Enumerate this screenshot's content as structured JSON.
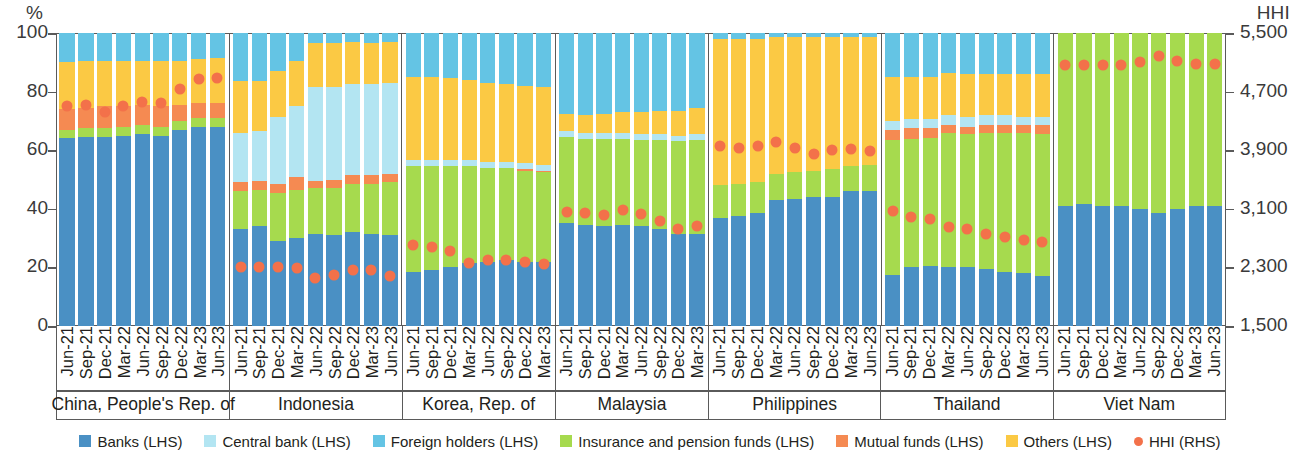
{
  "axes": {
    "left_unit": "%",
    "right_unit": "HHI",
    "left_ticks": [
      "100",
      "80",
      "60",
      "40",
      "20",
      "0"
    ],
    "right_ticks": [
      "5,500",
      "4,700",
      "3,900",
      "3,100",
      "2,300",
      "1,500"
    ]
  },
  "legend": [
    {
      "label": "Banks (LHS)",
      "color": "#4a90c4",
      "shape": "square"
    },
    {
      "label": "Central bank (LHS)",
      "color": "#b3e5f2",
      "shape": "square"
    },
    {
      "label": "Foreign holders (LHS)",
      "color": "#64c4e4",
      "shape": "square"
    },
    {
      "label": "Insurance and pension funds (LHS)",
      "color": "#a6da4e",
      "shape": "square"
    },
    {
      "label": "Mutual funds (LHS)",
      "color": "#f58a52",
      "shape": "square"
    },
    {
      "label": "Others (LHS)",
      "color": "#fbc944",
      "shape": "square"
    },
    {
      "label": "HHI (RHS)",
      "color": "#f3714a",
      "shape": "dot"
    }
  ],
  "chart_data": {
    "type": "bar",
    "subtype": "stacked-bar-with-overlay-scatter",
    "title": "",
    "xlabel": "",
    "ylabel": "%",
    "y2label": "HHI",
    "ylim": [
      0,
      100
    ],
    "y2lim": [
      1500,
      5500
    ],
    "grid": false,
    "legend_position": "bottom",
    "stack_order": [
      "Banks",
      "Insurance and pension funds",
      "Mutual funds",
      "Central bank",
      "Others",
      "Foreign holders"
    ],
    "series_colors": {
      "Banks": "#4a90c4",
      "Central bank": "#b3e5f2",
      "Foreign holders": "#64c4e4",
      "Insurance and pension funds": "#a6da4e",
      "Mutual funds": "#f58a52",
      "Others": "#fbc944",
      "HHI": "#f3714a"
    },
    "panels": [
      {
        "name": "China, People's Rep. of",
        "categories": [
          "Jun-21",
          "Sep-21",
          "Dec-21",
          "Mar-22",
          "Jun-22",
          "Sep-22",
          "Dec-22",
          "Mar-23",
          "Jun-23"
        ],
        "series": [
          {
            "name": "Banks",
            "values": [
              64.0,
              64.5,
              64.5,
              65.0,
              65.5,
              65.0,
              67.0,
              68.0,
              68.0
            ]
          },
          {
            "name": "Insurance and pension funds",
            "values": [
              3.0,
              3.0,
              3.0,
              3.0,
              3.0,
              3.0,
              3.0,
              3.0,
              3.0
            ]
          },
          {
            "name": "Mutual funds",
            "values": [
              7.0,
              7.0,
              7.5,
              7.0,
              7.0,
              7.0,
              5.5,
              5.0,
              5.0
            ]
          },
          {
            "name": "Central bank",
            "values": [
              0.0,
              0.0,
              0.0,
              0.0,
              0.0,
              0.0,
              0.0,
              0.0,
              0.0
            ]
          },
          {
            "name": "Others",
            "values": [
              16.0,
              16.0,
              15.5,
              15.5,
              15.0,
              15.5,
              15.0,
              15.0,
              15.5
            ]
          },
          {
            "name": "Foreign holders",
            "values": [
              10.0,
              9.5,
              9.5,
              9.5,
              9.5,
              9.5,
              9.5,
              9.0,
              8.5
            ]
          }
        ],
        "hhi": [
          4500,
          4520,
          4420,
          4500,
          4560,
          4540,
          4730,
          4870,
          4880
        ]
      },
      {
        "name": "Indonesia",
        "categories": [
          "Jun-21",
          "Sep-21",
          "Dec-21",
          "Mar-22",
          "Jun-22",
          "Sep-22",
          "Dec-22",
          "Mar-23",
          "Jun-23"
        ],
        "series": [
          {
            "name": "Banks",
            "values": [
              33.0,
              34.0,
              29.0,
              30.0,
              31.5,
              31.0,
              32.0,
              31.5,
              31.0
            ]
          },
          {
            "name": "Insurance and pension funds",
            "values": [
              13.0,
              12.5,
              16.5,
              16.5,
              15.5,
              16.0,
              16.5,
              17.0,
              18.0
            ]
          },
          {
            "name": "Mutual funds",
            "values": [
              3.0,
              3.0,
              3.0,
              4.5,
              2.5,
              3.0,
              3.0,
              3.0,
              3.0
            ]
          },
          {
            "name": "Central bank",
            "values": [
              17.0,
              17.0,
              23.0,
              24.0,
              32.0,
              31.5,
              31.0,
              31.0,
              31.0
            ]
          },
          {
            "name": "Others",
            "values": [
              17.5,
              17.0,
              15.5,
              15.5,
              15.0,
              15.0,
              14.5,
              14.0,
              14.0
            ]
          },
          {
            "name": "Foreign holders",
            "values": [
              16.5,
              16.5,
              13.0,
              9.5,
              3.5,
              3.5,
              3.0,
              3.5,
              3.0
            ]
          }
        ],
        "hhi": [
          2310,
          2310,
          2300,
          2290,
          2150,
          2190,
          2260,
          2260,
          2180
        ]
      },
      {
        "name": "Korea, Rep. of",
        "categories": [
          "Jun-21",
          "Sep-21",
          "Dec-21",
          "Mar-22",
          "Jun-22",
          "Sep-22",
          "Dec-22",
          "Mar-23"
        ],
        "series": [
          {
            "name": "Banks",
            "values": [
              18.5,
              19.0,
              20.0,
              21.5,
              22.0,
              22.5,
              22.0,
              22.0
            ]
          },
          {
            "name": "Insurance and pension funds",
            "values": [
              36.0,
              35.5,
              34.5,
              33.0,
              32.0,
              31.5,
              31.0,
              30.5
            ]
          },
          {
            "name": "Mutual funds",
            "values": [
              0.0,
              0.0,
              0.0,
              0.0,
              0.0,
              0.0,
              0.5,
              0.5
            ]
          },
          {
            "name": "Central bank",
            "values": [
              2.0,
              2.0,
              2.0,
              2.0,
              2.0,
              2.0,
              2.0,
              2.0
            ]
          },
          {
            "name": "Others",
            "values": [
              28.5,
              28.5,
              28.0,
              27.5,
              27.0,
              26.5,
              26.5,
              26.5
            ]
          },
          {
            "name": "Foreign holders",
            "values": [
              15.0,
              15.0,
              15.5,
              16.0,
              17.0,
              17.5,
              18.0,
              18.5
            ]
          }
        ],
        "hhi": [
          2600,
          2580,
          2520,
          2360,
          2400,
          2400,
          2370,
          2340
        ]
      },
      {
        "name": "Malaysia",
        "categories": [
          "Jun-21",
          "Sep-21",
          "Dec-21",
          "Mar-22",
          "Jun-22",
          "Sep-22",
          "Dec-22",
          "Mar-23"
        ],
        "series": [
          {
            "name": "Banks",
            "values": [
              35.0,
              34.5,
              34.0,
              34.5,
              34.0,
              33.0,
              31.5,
              31.5
            ]
          },
          {
            "name": "Insurance and pension funds",
            "values": [
              29.5,
              29.5,
              30.0,
              29.5,
              29.5,
              30.5,
              31.5,
              32.0
            ]
          },
          {
            "name": "Mutual funds",
            "values": [
              0.0,
              0.0,
              0.0,
              0.0,
              0.0,
              0.0,
              0.0,
              0.0
            ]
          },
          {
            "name": "Central bank",
            "values": [
              2.0,
              2.0,
              2.0,
              2.0,
              2.0,
              2.0,
              2.0,
              2.0
            ]
          },
          {
            "name": "Others",
            "values": [
              6.0,
              6.0,
              6.5,
              7.0,
              7.5,
              8.0,
              8.5,
              9.0
            ]
          },
          {
            "name": "Foreign holders",
            "values": [
              27.5,
              28.0,
              27.5,
              27.0,
              27.0,
              26.5,
              26.5,
              25.5
            ]
          }
        ],
        "hhi": [
          3060,
          3040,
          3020,
          3080,
          3030,
          2930,
          2830,
          2870
        ]
      },
      {
        "name": "Philippines",
        "categories": [
          "Jun-21",
          "Sep-21",
          "Dec-21",
          "Mar-22",
          "Jun-22",
          "Sep-22",
          "Dec-22",
          "Mar-23",
          "Jun-23"
        ],
        "series": [
          {
            "name": "Banks",
            "values": [
              37.0,
              37.5,
              38.5,
              43.0,
              43.5,
              44.0,
              44.0,
              46.0,
              46.0
            ]
          },
          {
            "name": "Insurance and pension funds",
            "values": [
              11.0,
              11.0,
              10.5,
              9.0,
              9.0,
              9.0,
              9.5,
              8.5,
              9.0
            ]
          },
          {
            "name": "Mutual funds",
            "values": [
              0.0,
              0.0,
              0.0,
              0.0,
              0.0,
              0.0,
              0.0,
              0.0,
              0.0
            ]
          },
          {
            "name": "Central bank",
            "values": [
              0.0,
              0.0,
              0.0,
              0.0,
              0.0,
              0.0,
              0.0,
              0.0,
              0.0
            ]
          },
          {
            "name": "Others",
            "values": [
              50.0,
              49.5,
              49.0,
              46.5,
              46.0,
              45.5,
              45.0,
              44.0,
              43.5
            ]
          },
          {
            "name": "Foreign holders",
            "values": [
              2.0,
              2.0,
              2.0,
              1.5,
              1.5,
              1.5,
              1.5,
              1.5,
              1.5
            ]
          }
        ],
        "hhi": [
          3960,
          3930,
          3960,
          4010,
          3930,
          3850,
          3900,
          3920,
          3890
        ]
      },
      {
        "name": "Thailand",
        "categories": [
          "Jun-21",
          "Sep-21",
          "Dec-21",
          "Mar-22",
          "Jun-22",
          "Sep-22",
          "Dec-22",
          "Mar-23",
          "Jun-23"
        ],
        "series": [
          {
            "name": "Banks",
            "values": [
              17.5,
              20.0,
              20.5,
              20.0,
              20.0,
              19.5,
              18.5,
              18.0,
              17.0
            ]
          },
          {
            "name": "Insurance and pension funds",
            "values": [
              46.0,
              44.0,
              43.5,
              46.0,
              45.5,
              46.5,
              47.5,
              48.0,
              48.5
            ]
          },
          {
            "name": "Mutual funds",
            "values": [
              3.5,
              3.5,
              3.5,
              2.5,
              2.5,
              2.5,
              2.5,
              2.5,
              3.0
            ]
          },
          {
            "name": "Central bank",
            "values": [
              3.0,
              3.0,
              3.0,
              3.5,
              3.5,
              3.5,
              3.5,
              3.0,
              3.0
            ]
          },
          {
            "name": "Others",
            "values": [
              15.0,
              14.5,
              14.5,
              14.5,
              14.5,
              14.0,
              14.0,
              14.5,
              14.5
            ]
          },
          {
            "name": "Foreign holders",
            "values": [
              15.0,
              15.0,
              15.0,
              13.5,
              14.0,
              14.0,
              14.0,
              14.0,
              14.0
            ]
          }
        ],
        "hhi": [
          3070,
          2990,
          2960,
          2850,
          2820,
          2760,
          2720,
          2680,
          2650
        ]
      },
      {
        "name": "Viet Nam",
        "categories": [
          "Jun-21",
          "Sep-21",
          "Dec-21",
          "Mar-22",
          "Jun-22",
          "Sep-22",
          "Dec-22",
          "Mar-23",
          "Jun-23"
        ],
        "series": [
          {
            "name": "Banks",
            "values": [
              41.0,
              41.5,
              41.0,
              41.0,
              40.0,
              38.5,
              40.0,
              41.0,
              41.0
            ]
          },
          {
            "name": "Insurance and pension funds",
            "values": [
              59.0,
              58.5,
              59.0,
              59.0,
              60.0,
              61.5,
              60.0,
              59.0,
              59.0
            ]
          },
          {
            "name": "Mutual funds",
            "values": [
              0.0,
              0.0,
              0.0,
              0.0,
              0.0,
              0.0,
              0.0,
              0.0,
              0.0
            ]
          },
          {
            "name": "Central bank",
            "values": [
              0.0,
              0.0,
              0.0,
              0.0,
              0.0,
              0.0,
              0.0,
              0.0,
              0.0
            ]
          },
          {
            "name": "Others",
            "values": [
              0.0,
              0.0,
              0.0,
              0.0,
              0.0,
              0.0,
              0.0,
              0.0,
              0.0
            ]
          },
          {
            "name": "Foreign holders",
            "values": [
              0.0,
              0.0,
              0.0,
              0.0,
              0.0,
              0.0,
              0.0,
              0.0,
              0.0
            ]
          }
        ],
        "hhi": [
          5060,
          5070,
          5060,
          5070,
          5110,
          5180,
          5120,
          5080,
          5080
        ]
      }
    ]
  }
}
